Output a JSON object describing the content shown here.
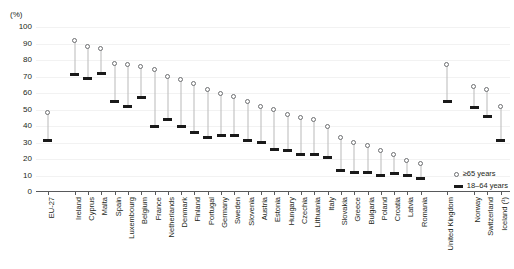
{
  "chart": {
    "unit_label": "(%)",
    "legend": [
      {
        "key": "old",
        "label": "≥65 years",
        "marker": "open-circle-marker"
      },
      {
        "key": "young",
        "label": "18–64 years",
        "marker": "filled-bar-marker"
      }
    ]
  },
  "chart_data": {
    "type": "scatter",
    "title": "",
    "subtitle": "",
    "xlabel": "",
    "ylabel": "(%)",
    "ylim": [
      0,
      100
    ],
    "yticks": [
      0,
      10,
      20,
      30,
      40,
      50,
      60,
      70,
      80,
      90,
      100
    ],
    "grid": true,
    "legend_position": "bottom-right",
    "categories": [
      "EU-27",
      "Ireland",
      "Cyprus",
      "Malta",
      "Spain",
      "Luxembourg",
      "Belgium",
      "France",
      "Netherlands",
      "Denmark",
      "Finland",
      "Portugal",
      "Germany",
      "Sweden",
      "Slovenia",
      "Austria",
      "Estonia",
      "Hungary",
      "Czechia",
      "Lithuania",
      "Italy",
      "Slovakia",
      "Greece",
      "Bulgaria",
      "Poland",
      "Croatia",
      "Latvia",
      "Romania",
      "United Kingdom",
      "Norway",
      "Switzerland",
      "Iceland (¹)"
    ],
    "group_breaks": [
      1,
      28,
      29
    ],
    "series": [
      {
        "name": "≥65 years",
        "marker": "open-circle",
        "values": [
          48,
          92,
          88,
          87,
          78,
          77,
          76,
          74,
          70,
          68,
          66,
          62,
          60,
          58,
          55,
          52,
          50,
          47,
          45,
          44,
          40,
          33,
          30,
          28,
          25,
          23,
          19,
          17,
          77,
          64,
          62,
          52
        ]
      },
      {
        "name": "18–64 years",
        "marker": "filled-bar",
        "values": [
          31,
          71,
          69,
          72,
          55,
          52,
          57,
          40,
          44,
          40,
          36,
          33,
          34,
          34,
          31,
          30,
          26,
          25,
          23,
          23,
          21,
          13,
          12,
          12,
          10,
          11,
          10,
          8,
          55,
          51,
          46,
          31
        ]
      }
    ]
  }
}
